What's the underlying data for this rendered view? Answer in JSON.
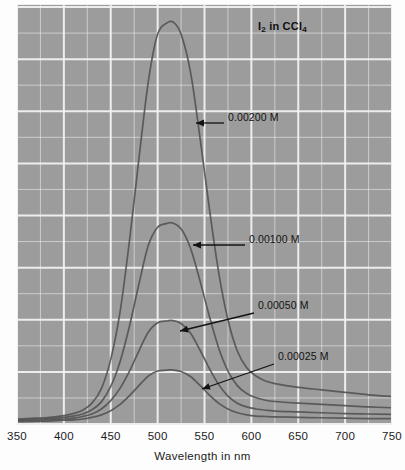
{
  "chart_data": {
    "type": "line",
    "title": "I2 in CCl4",
    "title_parts": {
      "pre": "I",
      "sub1": "2",
      "mid": " in CCl",
      "sub2": "4"
    },
    "xlabel": "Wavelength in nm",
    "ylabel": "",
    "xlim": [
      350,
      750
    ],
    "ylim": [
      0,
      1.0
    ],
    "xticks": [
      350,
      400,
      450,
      500,
      550,
      600,
      650,
      700,
      750
    ],
    "xtick_labels": [
      "350",
      "400",
      "450",
      "500",
      "550",
      "600",
      "650",
      "700",
      "750"
    ],
    "grid": true,
    "grid_minor": true,
    "grid_color": "#f2f2f2",
    "plot_background": "#9c9c9c",
    "curve_color": "#555555",
    "legend_position": "none",
    "series": [
      {
        "name": "0.00200 M",
        "concentration": 0.002,
        "peak_wavelength": 517,
        "peak_absorbance": 0.963,
        "x": [
          350,
          360,
          370,
          380,
          390,
          400,
          410,
          420,
          430,
          440,
          450,
          460,
          470,
          480,
          490,
          500,
          510,
          517,
          525,
          535,
          545,
          555,
          565,
          575,
          585,
          595,
          605,
          615,
          625,
          650,
          675,
          700,
          725,
          750
        ],
        "values": [
          0.012,
          0.013,
          0.014,
          0.015,
          0.017,
          0.02,
          0.025,
          0.033,
          0.05,
          0.085,
          0.155,
          0.27,
          0.44,
          0.635,
          0.82,
          0.935,
          0.962,
          0.963,
          0.935,
          0.845,
          0.69,
          0.52,
          0.365,
          0.25,
          0.175,
          0.135,
          0.115,
          0.103,
          0.097,
          0.088,
          0.082,
          0.076,
          0.07,
          0.066
        ]
      },
      {
        "name": "0.00100 M",
        "concentration": 0.001,
        "peak_wavelength": 516,
        "peak_absorbance": 0.482,
        "x": [
          350,
          360,
          370,
          380,
          390,
          400,
          410,
          420,
          430,
          440,
          450,
          460,
          470,
          480,
          490,
          500,
          510,
          516,
          525,
          535,
          545,
          555,
          565,
          575,
          585,
          595,
          605,
          615,
          625,
          650,
          675,
          700,
          725,
          750
        ],
        "values": [
          0.01,
          0.011,
          0.012,
          0.013,
          0.014,
          0.016,
          0.019,
          0.024,
          0.034,
          0.053,
          0.09,
          0.15,
          0.235,
          0.335,
          0.428,
          0.472,
          0.481,
          0.482,
          0.468,
          0.422,
          0.345,
          0.26,
          0.183,
          0.127,
          0.092,
          0.073,
          0.063,
          0.057,
          0.054,
          0.05,
          0.047,
          0.044,
          0.041,
          0.039
        ]
      },
      {
        "name": "0.00050 M",
        "concentration": 0.0005,
        "peak_wavelength": 516,
        "peak_absorbance": 0.248,
        "x": [
          350,
          360,
          370,
          380,
          390,
          400,
          410,
          420,
          430,
          440,
          450,
          460,
          470,
          480,
          490,
          500,
          510,
          516,
          525,
          535,
          545,
          555,
          565,
          575,
          585,
          595,
          605,
          615,
          625,
          650,
          675,
          700,
          725,
          750
        ],
        "values": [
          0.008,
          0.009,
          0.009,
          0.01,
          0.011,
          0.012,
          0.014,
          0.018,
          0.024,
          0.036,
          0.056,
          0.086,
          0.127,
          0.175,
          0.22,
          0.243,
          0.247,
          0.248,
          0.241,
          0.218,
          0.178,
          0.134,
          0.095,
          0.067,
          0.05,
          0.041,
          0.036,
          0.033,
          0.031,
          0.029,
          0.027,
          0.025,
          0.024,
          0.023
        ]
      },
      {
        "name": "0.00025 M",
        "concentration": 0.00025,
        "peak_wavelength": 515,
        "peak_absorbance": 0.13,
        "x": [
          350,
          360,
          370,
          380,
          390,
          400,
          410,
          420,
          430,
          440,
          450,
          460,
          470,
          480,
          490,
          500,
          510,
          515,
          525,
          535,
          545,
          555,
          565,
          575,
          585,
          595,
          605,
          615,
          625,
          650,
          675,
          700,
          725,
          750
        ],
        "values": [
          0.006,
          0.006,
          0.007,
          0.007,
          0.008,
          0.009,
          0.01,
          0.012,
          0.016,
          0.022,
          0.032,
          0.047,
          0.068,
          0.092,
          0.115,
          0.127,
          0.129,
          0.13,
          0.126,
          0.114,
          0.093,
          0.07,
          0.05,
          0.036,
          0.027,
          0.022,
          0.019,
          0.018,
          0.017,
          0.016,
          0.015,
          0.014,
          0.013,
          0.013
        ]
      }
    ],
    "annotations": [
      {
        "text": "0.00200 M",
        "label_x": 228,
        "label_y": 118,
        "arrow_from_x": 224,
        "arrow_from_y": 123,
        "arrow_to_x": 196,
        "arrow_to_y": 123
      },
      {
        "text": "0.00100 M",
        "label_x": 249,
        "label_y": 240,
        "arrow_from_x": 245,
        "arrow_from_y": 245,
        "arrow_to_x": 193,
        "arrow_to_y": 245
      },
      {
        "text": "0.00050 M",
        "label_x": 258,
        "label_y": 306,
        "arrow_from_x": 254,
        "arrow_from_y": 313,
        "arrow_to_x": 180,
        "arrow_to_y": 331
      },
      {
        "text": "0.00025 M",
        "label_x": 278,
        "label_y": 357,
        "arrow_from_x": 274,
        "arrow_from_y": 364,
        "arrow_to_x": 202,
        "arrow_to_y": 389
      }
    ]
  }
}
